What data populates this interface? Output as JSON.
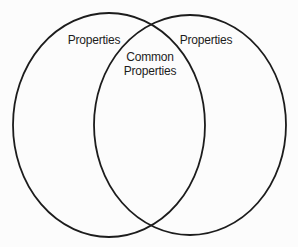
{
  "diagram": {
    "type": "venn",
    "background_color": "#fcfcfc",
    "stroke_color": "#1c1c1c",
    "text_color": "#1c1c1c",
    "left_circle": {
      "label": "Properties"
    },
    "right_circle": {
      "label": "Properties"
    },
    "intersection": {
      "label_line1": "Common",
      "label_line2": "Properties"
    }
  }
}
